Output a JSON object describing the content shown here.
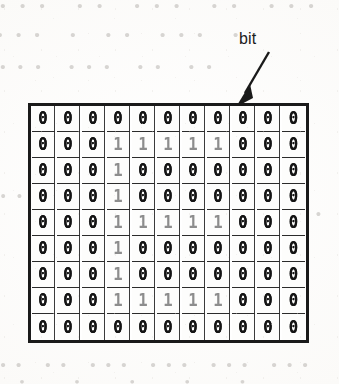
{
  "figure": {
    "kind": "bitmap-grid-diagram",
    "callout": {
      "label": "bit",
      "arrow": "arrow-pointing-down-left-to-grid-cell"
    },
    "grid": {
      "rows": 9,
      "columns": 11,
      "glyph_zero": "0",
      "glyph_one": "1",
      "zero_color": "#141414",
      "one_color": "#8d8d8d",
      "border_color": "#1a1a1a",
      "cell_border_color": "#2b2b2b",
      "cell_background": "#fdfdfc",
      "depicted_shape": "letter E",
      "bits": [
        [
          0,
          0,
          0,
          0,
          0,
          0,
          0,
          0,
          0,
          0,
          0
        ],
        [
          0,
          0,
          0,
          1,
          1,
          1,
          1,
          1,
          0,
          0,
          0
        ],
        [
          0,
          0,
          0,
          1,
          0,
          0,
          0,
          0,
          0,
          0,
          0
        ],
        [
          0,
          0,
          0,
          1,
          0,
          0,
          0,
          0,
          0,
          0,
          0
        ],
        [
          0,
          0,
          0,
          1,
          1,
          1,
          1,
          1,
          0,
          0,
          0
        ],
        [
          0,
          0,
          0,
          1,
          0,
          0,
          0,
          0,
          0,
          0,
          0
        ],
        [
          0,
          0,
          0,
          1,
          0,
          0,
          0,
          0,
          0,
          0,
          0
        ],
        [
          0,
          0,
          0,
          1,
          1,
          1,
          1,
          1,
          0,
          0,
          0
        ],
        [
          0,
          0,
          0,
          0,
          0,
          0,
          0,
          0,
          0,
          0,
          0
        ]
      ]
    },
    "page_bleedthrough": {
      "note": "faint illegible mirrored text from the reverse side of the scanned page",
      "top_line_1": "••• •• ••• •• •••",
      "top_line_2": "••• • •• ••• ••",
      "top_line_3": "••• ••• •• ••",
      "mid_line_1": "•• •••",
      "mid_line_2": "••",
      "bottom_line_1": "•• •• ••• ••• ••• •••",
      "bottom_line_2": "• • • • •"
    }
  }
}
